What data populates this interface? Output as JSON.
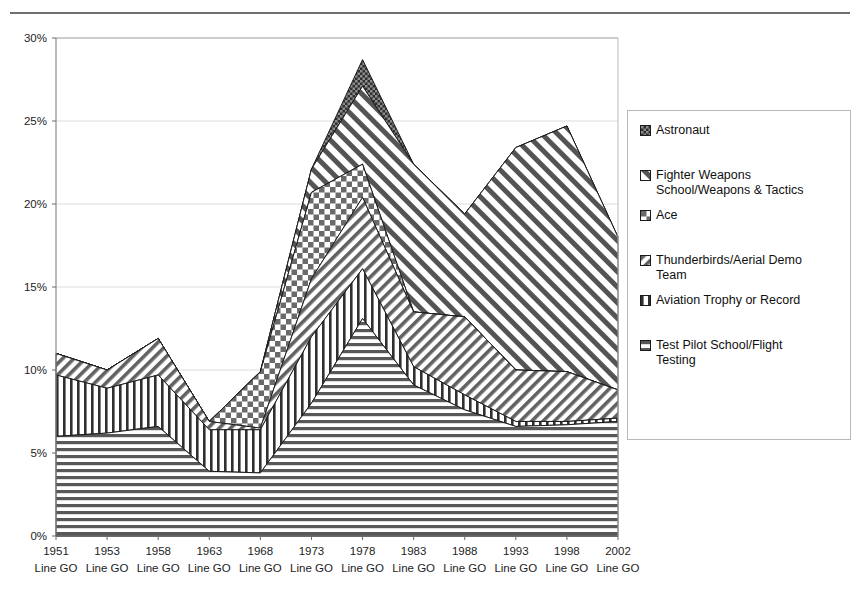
{
  "legend": {
    "position": "right",
    "items": [
      {
        "label": "Astronaut",
        "swatch": "dense-checker-dark-swatch",
        "color": "#3a3a3a"
      },
      {
        "label": "Fighter Weapons\nSchool/Weapons & Tactics",
        "swatch": "diagonal-nw-swatch",
        "color": "#4a4a4a"
      },
      {
        "label": "Ace",
        "swatch": "checkerboard-swatch",
        "color": "#555555"
      },
      {
        "label": "Thunderbirds/Aerial Demo\nTeam",
        "swatch": "diagonal-ne-swatch",
        "color": "#5a5a5a"
      },
      {
        "label": "Aviation Trophy or Record",
        "swatch": "vertical-lines-swatch",
        "color": "#3f3f3f"
      },
      {
        "label": "Test Pilot School/Flight\nTesting",
        "swatch": "horizontal-lines-swatch",
        "color": "#4f4f4f"
      }
    ]
  },
  "chart_data": {
    "type": "area",
    "stacked": true,
    "title": "",
    "subtitle": "",
    "xlabel": "",
    "ylabel": "",
    "grid": true,
    "ylim": [
      0,
      30
    ],
    "yticks": [
      0,
      5,
      10,
      15,
      20,
      25,
      30
    ],
    "ytick_labels": [
      "0%",
      "5%",
      "10%",
      "15%",
      "20%",
      "25%",
      "30%"
    ],
    "categories": [
      "1951",
      "1953",
      "1958",
      "1963",
      "1968",
      "1973",
      "1978",
      "1983",
      "1988",
      "1993",
      "1998",
      "2002"
    ],
    "category_sublabels": [
      "Line GO",
      "Line GO",
      "Line GO",
      "Line GO",
      "Line GO",
      "Line GO",
      "Line GO",
      "Line GO",
      "Line GO",
      "Line GO",
      "Line GO",
      "Line GO"
    ],
    "series": [
      {
        "name": "Test Pilot School/Flight Testing",
        "pattern": "horizontal-lines",
        "values": [
          6.0,
          6.2,
          6.6,
          3.9,
          3.8,
          8.0,
          13.1,
          9.1,
          7.6,
          6.6,
          6.7,
          6.9
        ]
      },
      {
        "name": "Aviation Trophy or Record",
        "pattern": "vertical-lines",
        "values": [
          3.7,
          2.7,
          3.1,
          2.5,
          2.6,
          4.0,
          3.0,
          1.1,
          0.9,
          0.3,
          0.2,
          0.2
        ]
      },
      {
        "name": "Thunderbirds/Aerial Demo Team",
        "pattern": "diagonal-ne",
        "values": [
          1.3,
          1.1,
          2.2,
          0.5,
          0.1,
          3.5,
          4.3,
          3.3,
          4.7,
          3.1,
          3.0,
          1.7
        ]
      },
      {
        "name": "Ace",
        "pattern": "checkerboard",
        "values": [
          0.0,
          0.0,
          0.0,
          0.0,
          3.4,
          5.2,
          2.0,
          0.0,
          0.0,
          0.0,
          0.0,
          0.0
        ]
      },
      {
        "name": "Fighter Weapons School/Weapons & Tactics",
        "pattern": "diagonal-nw",
        "values": [
          0.0,
          0.0,
          0.0,
          0.0,
          0.0,
          1.4,
          4.7,
          8.9,
          6.2,
          13.4,
          14.8,
          9.2
        ]
      },
      {
        "name": "Astronaut",
        "pattern": "dense-checker-dark",
        "values": [
          0.0,
          0.0,
          0.0,
          0.0,
          0.0,
          0.0,
          1.6,
          0.0,
          0.0,
          0.0,
          0.0,
          0.0
        ]
      }
    ],
    "stack_order_bottom_to_top": [
      "Test Pilot School/Flight Testing",
      "Aviation Trophy or Record",
      "Thunderbirds/Aerial Demo Team",
      "Ace",
      "Fighter Weapons School/Weapons & Tactics",
      "Astronaut"
    ],
    "stack_totals": [
      11.0,
      10.0,
      11.9,
      6.9,
      9.9,
      22.1,
      28.7,
      21.4,
      19.4,
      23.4,
      24.7,
      18.0
    ]
  },
  "axis": {
    "y_axis_name": "percent-axis",
    "x_axis_name": "year-axis"
  }
}
